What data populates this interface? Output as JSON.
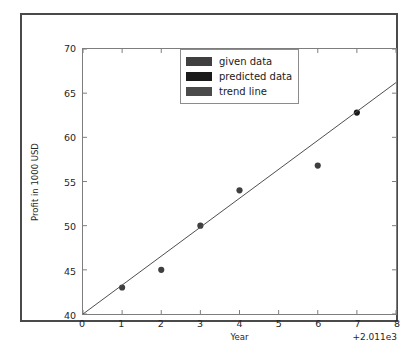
{
  "chart_data": {
    "type": "scatter",
    "title": "",
    "xlabel": "Year",
    "ylabel": "Profit in 1000 USD",
    "x_offset_label": "+2.011e3",
    "xlim": [
      0,
      8
    ],
    "ylim": [
      40,
      70
    ],
    "xticks": [
      "0",
      "1",
      "2",
      "3",
      "4",
      "5",
      "6",
      "7",
      "8"
    ],
    "xtick_values": [
      0,
      1,
      2,
      3,
      4,
      5,
      6,
      7,
      8
    ],
    "yticks": [
      "40",
      "45",
      "50",
      "55",
      "60",
      "65",
      "70"
    ],
    "ytick_values": [
      40,
      45,
      50,
      55,
      60,
      65,
      70
    ],
    "grid": false,
    "legend_position": "upper center",
    "series": [
      {
        "name": "given data",
        "type": "scatter",
        "color": "#3f3f3f",
        "x": [
          1,
          2,
          3,
          4,
          6
        ],
        "y": [
          43.0,
          45.0,
          50.0,
          54.0,
          56.8
        ]
      },
      {
        "name": "predicted data",
        "type": "scatter",
        "color": "#1a1a1a",
        "x": [
          7
        ],
        "y": [
          62.8
        ]
      },
      {
        "name": "trend line",
        "type": "line",
        "color": "#4d4d4d",
        "x": [
          0,
          8
        ],
        "y": [
          40.0,
          66.2
        ]
      }
    ]
  },
  "legend": {
    "entries": [
      {
        "label": "given data",
        "color": "#3f3f3f"
      },
      {
        "label": "predicted data",
        "color": "#1a1a1a"
      },
      {
        "label": "trend line",
        "color": "#4a4a4a"
      }
    ]
  }
}
